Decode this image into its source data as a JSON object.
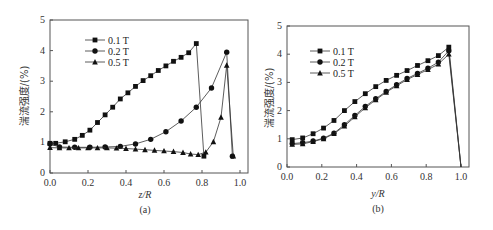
{
  "chart_data": [
    {
      "type": "line",
      "panel": "(a)",
      "xlabel": "z/R",
      "ylabel": "湍流强度/(%)",
      "xlim": [
        0.0,
        1.0
      ],
      "ylim": [
        0,
        5
      ],
      "xticks": [
        "0.0",
        "0.2",
        "0.4",
        "0.6",
        "0.8",
        "1.0"
      ],
      "yticks": [
        "0",
        "1",
        "2",
        "3",
        "4",
        "5"
      ],
      "legend_position": "upper left",
      "grid": false,
      "series": [
        {
          "name": "0.1 T",
          "marker": "square",
          "x": [
            0.0,
            0.03,
            0.08,
            0.13,
            0.17,
            0.21,
            0.25,
            0.29,
            0.33,
            0.37,
            0.41,
            0.45,
            0.49,
            0.53,
            0.57,
            0.61,
            0.65,
            0.69,
            0.73,
            0.77,
            0.81,
            0.85,
            0.89,
            0.93,
            0.96
          ],
          "y": [
            0.97,
            0.97,
            1.02,
            1.1,
            1.23,
            1.4,
            1.65,
            1.9,
            2.15,
            2.42,
            2.62,
            2.83,
            3.02,
            3.18,
            3.35,
            3.5,
            3.65,
            3.78,
            3.93,
            4.23,
            0.55
          ]
        },
        {
          "name": "0.2 T",
          "marker": "circle",
          "x": [
            0.0,
            0.05,
            0.13,
            0.21,
            0.29,
            0.37,
            0.45,
            0.53,
            0.61,
            0.69,
            0.77,
            0.85,
            0.93,
            0.96
          ],
          "y": [
            0.95,
            0.85,
            0.84,
            0.84,
            0.85,
            0.87,
            0.95,
            1.1,
            1.35,
            1.7,
            2.15,
            2.78,
            3.95,
            0.55
          ]
        },
        {
          "name": "0.5 T",
          "marker": "triangle",
          "x": [
            0.0,
            0.05,
            0.1,
            0.15,
            0.2,
            0.25,
            0.3,
            0.35,
            0.4,
            0.45,
            0.5,
            0.55,
            0.6,
            0.65,
            0.7,
            0.74,
            0.78,
            0.82,
            0.86,
            0.9,
            0.93,
            0.965
          ],
          "y": [
            0.83,
            0.82,
            0.82,
            0.82,
            0.82,
            0.82,
            0.82,
            0.81,
            0.8,
            0.78,
            0.76,
            0.74,
            0.72,
            0.7,
            0.67,
            0.62,
            0.6,
            0.68,
            1.02,
            1.82,
            3.52,
            0.55
          ]
        }
      ]
    },
    {
      "type": "line",
      "panel": "(b)",
      "xlabel": "y/R",
      "ylabel": "湍流强度/(%)",
      "xlim": [
        0.0,
        1.0
      ],
      "ylim": [
        0,
        5
      ],
      "xticks": [
        "0.0",
        "0.2",
        "0.4",
        "0.6",
        "0.8",
        "1.0"
      ],
      "yticks": [
        "0",
        "1",
        "2",
        "3",
        "4",
        "5"
      ],
      "legend_position": "upper left",
      "grid": false,
      "series": [
        {
          "name": "0.1 T",
          "marker": "square",
          "x": [
            0.03,
            0.09,
            0.15,
            0.21,
            0.27,
            0.33,
            0.39,
            0.45,
            0.51,
            0.57,
            0.63,
            0.69,
            0.75,
            0.81,
            0.87,
            0.93,
            1.0
          ],
          "y": [
            0.97,
            1.03,
            1.18,
            1.38,
            1.65,
            2.0,
            2.32,
            2.6,
            2.85,
            3.07,
            3.25,
            3.42,
            3.6,
            3.77,
            3.95,
            4.25,
            0.0
          ]
        },
        {
          "name": "0.2 T",
          "marker": "circle",
          "x": [
            0.03,
            0.09,
            0.15,
            0.21,
            0.27,
            0.33,
            0.39,
            0.45,
            0.51,
            0.57,
            0.63,
            0.69,
            0.75,
            0.81,
            0.87,
            0.93,
            1.0
          ],
          "y": [
            0.83,
            0.86,
            0.92,
            1.02,
            1.2,
            1.5,
            1.83,
            2.15,
            2.42,
            2.68,
            2.92,
            3.14,
            3.32,
            3.5,
            3.72,
            4.12,
            0.0
          ]
        },
        {
          "name": "0.5 T",
          "marker": "triangle",
          "x": [
            0.03,
            0.09,
            0.15,
            0.21,
            0.27,
            0.33,
            0.39,
            0.45,
            0.51,
            0.57,
            0.63,
            0.69,
            0.75,
            0.81,
            0.87,
            0.93,
            1.0
          ],
          "y": [
            0.8,
            0.82,
            0.9,
            1.0,
            1.18,
            1.45,
            1.78,
            2.1,
            2.38,
            2.65,
            2.88,
            3.1,
            3.28,
            3.45,
            3.65,
            4.0,
            0.0
          ]
        }
      ]
    }
  ],
  "panels": {
    "a": {
      "caption": "(a)",
      "xlabel": "z/R",
      "ylabel": "湍流强度/(%)"
    },
    "b": {
      "caption": "(b)",
      "xlabel": "y/R",
      "ylabel": "湍流强度/(%)"
    }
  },
  "legend": [
    "0.1 T",
    "0.2 T",
    "0.5 T"
  ],
  "ticks": {
    "x": [
      "0.0",
      "0.2",
      "0.4",
      "0.6",
      "0.8",
      "1.0"
    ],
    "y": [
      "0",
      "1",
      "2",
      "3",
      "4",
      "5"
    ]
  }
}
